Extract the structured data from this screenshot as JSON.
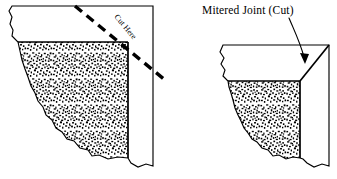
{
  "figure": {
    "title": "Mitered Joint (Cut)",
    "background_color": "#ffffff",
    "ink_color": "#000000"
  },
  "left_diagram": {
    "name": "stone-block-before-cut",
    "cut_line_label": "Cut Here",
    "cut_line_style": "dashed",
    "cut_line_angle_deg": 45,
    "texture": "stippled-stone",
    "faces": [
      {
        "name": "top-face",
        "fill": "white"
      },
      {
        "name": "front-face",
        "fill": "stipple"
      },
      {
        "name": "right-face",
        "fill": "white"
      }
    ]
  },
  "right_diagram": {
    "name": "stone-block-mitered-corner",
    "caption": "Mitered Joint (Cut)",
    "joint_type": "mitered",
    "texture": "stippled-stone",
    "leader": {
      "name": "callout-arrow",
      "style": "curved-with-arrowhead",
      "points_to": "miter-seam"
    },
    "faces": [
      {
        "name": "top-face",
        "fill": "white"
      },
      {
        "name": "front-face",
        "fill": "stipple"
      },
      {
        "name": "right-face",
        "fill": "white"
      }
    ]
  }
}
